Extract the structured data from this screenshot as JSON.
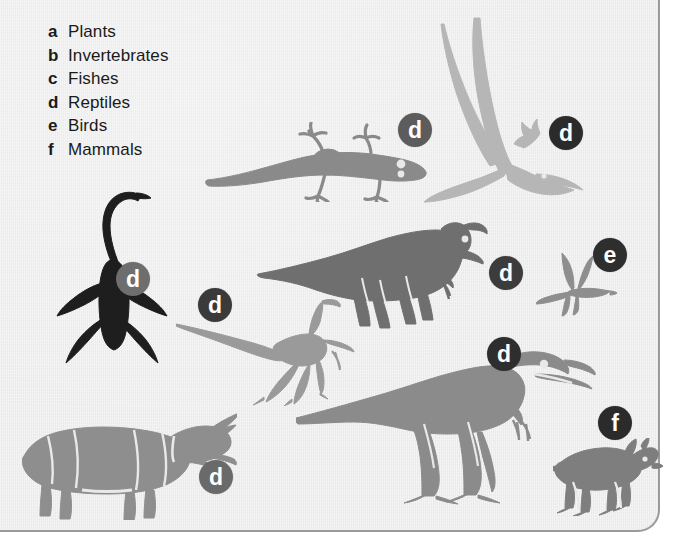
{
  "figure": {
    "background_color": "#e9e9e9",
    "border_color": "#9a9a9a",
    "text_color": "#1a1a1a"
  },
  "legend": {
    "name": "organism-group-key",
    "items": [
      {
        "key": "a",
        "label": "Plants"
      },
      {
        "key": "b",
        "label": "Invertebrates"
      },
      {
        "key": "c",
        "label": "Fishes"
      },
      {
        "key": "d",
        "label": "Reptiles"
      },
      {
        "key": "e",
        "label": "Birds"
      },
      {
        "key": "f",
        "label": "Mammals"
      }
    ]
  },
  "organisms": [
    {
      "name": "lizard",
      "key": "d",
      "group": "Reptiles",
      "fill": "#8a8a8a",
      "badge": {
        "letter": "d",
        "color": "#5c5c5c",
        "size": 34,
        "font_size": 23,
        "x": 398,
        "y": 113
      },
      "box": {
        "x": 205,
        "y": 122,
        "w": 225,
        "h": 80
      }
    },
    {
      "name": "pterosaur",
      "key": "d",
      "group": "Reptiles",
      "fill": "#b6b6b6",
      "badge": {
        "letter": "d",
        "color": "#2b2b2b",
        "size": 34,
        "font_size": 23,
        "x": 549,
        "y": 116
      },
      "box": {
        "x": 424,
        "y": 16,
        "w": 160,
        "h": 192
      }
    },
    {
      "name": "plesiosaur",
      "key": "d",
      "group": "Reptiles",
      "fill": "#1e1e1e",
      "badge": {
        "letter": "d",
        "color": "#6e6e6e",
        "size": 34,
        "font_size": 23,
        "x": 116,
        "y": 262
      },
      "box": {
        "x": 56,
        "y": 190,
        "w": 112,
        "h": 175
      }
    },
    {
      "name": "hadrosaur",
      "key": "d",
      "group": "Reptiles",
      "fill": "#6f6f6f",
      "badge": {
        "letter": "d",
        "color": "#3c3c3c",
        "size": 34,
        "font_size": 23,
        "x": 489,
        "y": 256
      },
      "box": {
        "x": 256,
        "y": 222,
        "w": 235,
        "h": 112
      }
    },
    {
      "name": "bird",
      "key": "e",
      "group": "Birds",
      "fill": "#8e8e8e",
      "badge": {
        "letter": "e",
        "color": "#2e2e2e",
        "size": 34,
        "font_size": 23,
        "x": 593,
        "y": 238
      },
      "box": {
        "x": 536,
        "y": 252,
        "w": 82,
        "h": 65
      }
    },
    {
      "name": "ornithomimid",
      "key": "d",
      "group": "Reptiles",
      "fill": "#9a9a9a",
      "badge": {
        "letter": "d",
        "color": "#3a3a3a",
        "size": 34,
        "font_size": 23,
        "x": 198,
        "y": 288
      },
      "box": {
        "x": 176,
        "y": 296,
        "w": 190,
        "h": 110
      }
    },
    {
      "name": "theropod",
      "key": "d",
      "group": "Reptiles",
      "fill": "#8b8b8b",
      "badge": {
        "letter": "d",
        "color": "#2e2e2e",
        "size": 34,
        "font_size": 23,
        "x": 487,
        "y": 337
      },
      "box": {
        "x": 296,
        "y": 340,
        "w": 300,
        "h": 165
      }
    },
    {
      "name": "triceratops",
      "key": "d",
      "group": "Reptiles",
      "fill": "#8e8e8e",
      "badge": {
        "letter": "d",
        "color": "#6a6a6a",
        "size": 34,
        "font_size": 23,
        "x": 199,
        "y": 460
      },
      "box": {
        "x": 22,
        "y": 410,
        "w": 215,
        "h": 110
      }
    },
    {
      "name": "mammal",
      "key": "f",
      "group": "Mammals",
      "fill": "#7e7e7e",
      "badge": {
        "letter": "f",
        "color": "#2b2b2b",
        "size": 34,
        "font_size": 23,
        "x": 598,
        "y": 406
      },
      "box": {
        "x": 553,
        "y": 438,
        "w": 110,
        "h": 78
      }
    }
  ]
}
